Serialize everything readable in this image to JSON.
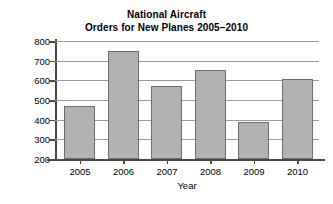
{
  "chart_data": {
    "type": "bar",
    "title_lines": [
      "National Aircraft",
      "Orders for New Planes 2005–2010"
    ],
    "xlabel": "Year",
    "ylabel": "Number of Planes Ordered",
    "categories": [
      "2005",
      "2006",
      "2007",
      "2008",
      "2009",
      "2010"
    ],
    "values": [
      470,
      750,
      570,
      655,
      388,
      605
    ],
    "ylim": [
      200,
      800
    ],
    "yticks": [
      200,
      300,
      400,
      500,
      600,
      700,
      800
    ],
    "ytick_labels": [
      "200",
      "300",
      "400",
      "500",
      "600",
      "700",
      "800"
    ],
    "grid": true,
    "grid_axis": "y",
    "legend": false,
    "legend_position": "none",
    "bar_color": "#b2b2b2",
    "bar_edge_color": "#6e6e6e",
    "grid_color": "#9a9a9a",
    "axis_color": "#4a4a4a",
    "text_color": "#000000",
    "background_color": "#ffffff"
  }
}
